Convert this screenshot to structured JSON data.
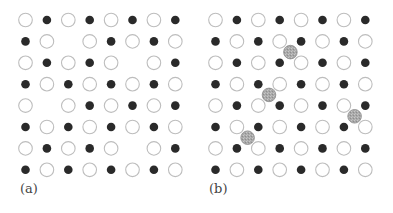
{
  "figure": {
    "panels": [
      {
        "label": "(a)",
        "description": "Ionic lattice with vacancies",
        "grid": [
          "OFOFOFOF",
          "FO_OFOFO",
          "OFOFO_OF",
          "FOFOFOFO",
          "O_OFOFOF",
          "FOFOFOFO",
          "OFOFO_OF",
          "FOFOFOFO"
        ],
        "interstitials": []
      },
      {
        "label": "(b)",
        "description": "Ionic lattice with interstitials",
        "grid": [
          "OFOFOFOF",
          "FOFOFOFO",
          "OFOFOFOF",
          "FOFOFOFO",
          "OFOFOFOF",
          "FOFOFOFO",
          "OFOFOFOF",
          "FOFOFOFO"
        ],
        "interstitials": [
          {
            "between_rows": [
              2,
              3
            ],
            "between_cols": [
              4,
              5
            ]
          },
          {
            "between_rows": [
              4,
              5
            ],
            "between_cols": [
              3,
              4
            ]
          },
          {
            "between_rows": [
              5,
              6
            ],
            "between_cols": [
              7,
              8
            ]
          },
          {
            "between_rows": [
              6,
              7
            ],
            "between_cols": [
              2,
              3
            ]
          }
        ]
      }
    ],
    "legend": {
      "O": "open-ion",
      "F": "filled-ion",
      "_": "vacancy"
    },
    "colors": {
      "open_stroke": "#bdbdbd",
      "filled": "#2a2a2a",
      "interstitial_fill": "#a8a8a8",
      "interstitial_stroke": "#8a8a8a"
    }
  }
}
